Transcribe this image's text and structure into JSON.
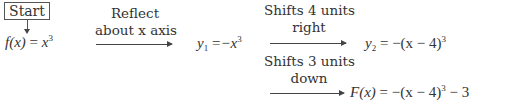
{
  "start": {
    "label": "Start"
  },
  "steps": [
    {
      "label_line1": "Reflect",
      "label_line2": "about x axis"
    },
    {
      "label_line1": "Shifts 4 units",
      "label_line2": "right"
    },
    {
      "label_line1": "Shifts 3 units",
      "label_line2": "down"
    }
  ],
  "equations": {
    "f": {
      "lhs": "f(x)",
      "eq": "=",
      "base": "x",
      "exp": "3"
    },
    "y1": {
      "name": "y",
      "sub": "1",
      "eq": "=",
      "rhs": "−x",
      "exp": "3"
    },
    "y2": {
      "name": "y",
      "sub": "2",
      "eq": "=",
      "rhs": "−(x − 4)",
      "exp": "3"
    },
    "F": {
      "lhs": "F(x)",
      "eq": "=",
      "rhs": "−(x − 4)",
      "exp": "3",
      "tail": "− 3"
    }
  }
}
